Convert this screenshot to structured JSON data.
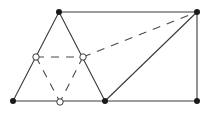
{
  "diagram": {
    "type": "geometry-figure",
    "colors": {
      "line": "#3a3a3a",
      "filled_point": "#1a1a1a",
      "background": "#ffffff"
    },
    "points": {
      "A": {
        "x": 59,
        "y": 12,
        "style": "filled"
      },
      "B": {
        "x": 197,
        "y": 12,
        "style": "filled"
      },
      "C": {
        "x": 13,
        "y": 101,
        "style": "filled"
      },
      "D": {
        "x": 105,
        "y": 101,
        "style": "filled"
      },
      "E": {
        "x": 197,
        "y": 101,
        "style": "filled"
      },
      "M1": {
        "x": 36,
        "y": 57,
        "style": "open"
      },
      "M2": {
        "x": 83,
        "y": 57,
        "style": "open"
      },
      "M3": {
        "x": 60,
        "y": 102,
        "style": "open"
      }
    },
    "solid_segments": [
      [
        "A",
        "B"
      ],
      [
        "A",
        "C"
      ],
      [
        "A",
        "D"
      ],
      [
        "C",
        "D"
      ],
      [
        "D",
        "E"
      ],
      [
        "B",
        "E"
      ],
      [
        "D",
        "B"
      ]
    ],
    "dashed_segments": [
      [
        "M1",
        "M2"
      ],
      [
        "M2",
        "B"
      ],
      [
        "M1",
        "M3"
      ],
      [
        "M2",
        "M3"
      ]
    ]
  }
}
